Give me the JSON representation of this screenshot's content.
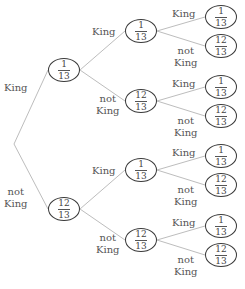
{
  "diagram": {
    "type": "probability-tree",
    "root": {
      "x": 14,
      "y": 144
    },
    "level1": [
      {
        "id": "n1",
        "prob": {
          "num": "1",
          "den": "13"
        },
        "cx": 64,
        "cy": 70,
        "edge_label": [
          "King"
        ],
        "label_x": 4,
        "label_y": 82
      },
      {
        "id": "n2",
        "prob": {
          "num": "12",
          "den": "13"
        },
        "cx": 64,
        "cy": 209,
        "edge_label": [
          "not",
          "King"
        ],
        "label_x": 4,
        "label_y": 186
      }
    ],
    "level2": [
      {
        "id": "n11",
        "parent": "n1",
        "prob": {
          "num": "1",
          "den": "13"
        },
        "cx": 141,
        "cy": 31,
        "edge_label": [
          "King"
        ],
        "label_x": 92,
        "label_y": 26
      },
      {
        "id": "n12",
        "parent": "n1",
        "prob": {
          "num": "12",
          "den": "13"
        },
        "cx": 141,
        "cy": 101,
        "edge_label": [
          "not",
          "King"
        ],
        "label_x": 96,
        "label_y": 93
      },
      {
        "id": "n21",
        "parent": "n2",
        "prob": {
          "num": "1",
          "den": "13"
        },
        "cx": 141,
        "cy": 170,
        "edge_label": [
          "King"
        ],
        "label_x": 92,
        "label_y": 165
      },
      {
        "id": "n22",
        "parent": "n2",
        "prob": {
          "num": "12",
          "den": "13"
        },
        "cx": 141,
        "cy": 240,
        "edge_label": [
          "not",
          "King"
        ],
        "label_x": 96,
        "label_y": 232
      }
    ],
    "level3": [
      {
        "id": "n111",
        "parent": "n11",
        "prob": {
          "num": "1",
          "den": "13"
        },
        "cx": 221,
        "cy": 17,
        "edge_label": [
          "King"
        ],
        "label_x": 172,
        "label_y": 8
      },
      {
        "id": "n112",
        "parent": "n11",
        "prob": {
          "num": "12",
          "den": "13"
        },
        "cx": 221,
        "cy": 46,
        "edge_label": [
          "not",
          "King"
        ],
        "label_x": 174,
        "label_y": 45
      },
      {
        "id": "n121",
        "parent": "n12",
        "prob": {
          "num": "1",
          "den": "13"
        },
        "cx": 221,
        "cy": 87,
        "edge_label": [
          "King"
        ],
        "label_x": 172,
        "label_y": 78
      },
      {
        "id": "n122",
        "parent": "n12",
        "prob": {
          "num": "12",
          "den": "13"
        },
        "cx": 221,
        "cy": 116,
        "edge_label": [
          "not",
          "King"
        ],
        "label_x": 174,
        "label_y": 115
      },
      {
        "id": "n211",
        "parent": "n21",
        "prob": {
          "num": "1",
          "den": "13"
        },
        "cx": 221,
        "cy": 156,
        "edge_label": [
          "King"
        ],
        "label_x": 172,
        "label_y": 147
      },
      {
        "id": "n212",
        "parent": "n21",
        "prob": {
          "num": "12",
          "den": "13"
        },
        "cx": 221,
        "cy": 185,
        "edge_label": [
          "not",
          "King"
        ],
        "label_x": 174,
        "label_y": 184
      },
      {
        "id": "n221",
        "parent": "n22",
        "prob": {
          "num": "1",
          "den": "13"
        },
        "cx": 221,
        "cy": 226,
        "edge_label": [
          "King"
        ],
        "label_x": 172,
        "label_y": 217
      },
      {
        "id": "n222",
        "parent": "n22",
        "prob": {
          "num": "12",
          "den": "13"
        },
        "cx": 221,
        "cy": 255,
        "edge_label": [
          "not",
          "King"
        ],
        "label_x": 174,
        "label_y": 254
      }
    ]
  },
  "colors": {
    "edge": "#bdbdbd",
    "node_border": "#3a3a3a",
    "text": "#555555"
  }
}
